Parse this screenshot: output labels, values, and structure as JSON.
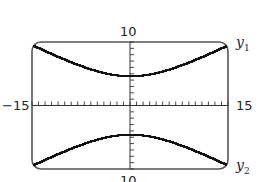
{
  "chart_data": {
    "type": "line",
    "title": "",
    "xlabel": "",
    "ylabel": "",
    "xlim": [
      -15,
      15
    ],
    "ylim": [
      -10,
      10
    ],
    "x_ticks_scale": 1,
    "y_ticks_scale": 1,
    "grid": false,
    "tick_labels": {
      "xmin": "−15",
      "xmax": "15",
      "ymax": "10",
      "ymin": "10"
    },
    "series": [
      {
        "name": "y1",
        "label_main": "y",
        "label_sub": "1",
        "x": [
          -15,
          -12,
          -9,
          -6,
          -3,
          0,
          3,
          6,
          9,
          12,
          15
        ],
        "values": [
          9.5,
          8.3,
          7.2,
          6.1,
          5.1,
          4.6,
          5.1,
          6.1,
          7.2,
          8.3,
          9.5
        ]
      },
      {
        "name": "y2",
        "label_main": "y",
        "label_sub": "2",
        "x": [
          -15,
          -12,
          -9,
          -6,
          -3,
          0,
          3,
          6,
          9,
          12,
          15
        ],
        "values": [
          -9.5,
          -8.3,
          -7.2,
          -6.1,
          -5.1,
          -4.6,
          -5.1,
          -6.1,
          -7.2,
          -8.3,
          -9.5
        ]
      }
    ],
    "style": {
      "frame_color": "#555555",
      "curve_color": "#111111",
      "axis_color": "#333333"
    }
  }
}
